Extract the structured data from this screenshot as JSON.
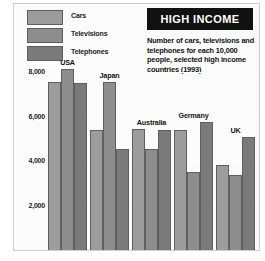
{
  "chart_data": {
    "type": "bar",
    "title": "HIGH INCOME",
    "subtitle": "Number of cars, televisions and telephones for each 10,000 people, selected high income countries (1993)",
    "xlabel": "",
    "ylabel": "",
    "ylim": [
      0,
      8800
    ],
    "grid": true,
    "legend_position": "top-left",
    "yticks": [
      2000,
      4000,
      6000,
      8000
    ],
    "ytick_labels": [
      "2,000",
      "4,000",
      "6,000",
      "8,000"
    ],
    "categories": [
      "USA",
      "Japan",
      "Australia",
      "Germany",
      "UK"
    ],
    "series": [
      {
        "name": "Cars",
        "color": "#9c9c9c",
        "values": [
          7550,
          5400,
          5450,
          5400,
          3800
        ]
      },
      {
        "name": "Televisions",
        "color": "#8d8d8d",
        "values": [
          8150,
          7550,
          4550,
          3500,
          3350
        ]
      },
      {
        "name": "Telephones",
        "color": "#7a7a7a",
        "values": [
          7500,
          4550,
          5400,
          5750,
          5100
        ]
      }
    ]
  },
  "legend": {
    "items": [
      {
        "label": "Cars"
      },
      {
        "label": "Televisions"
      },
      {
        "label": "Telephones"
      }
    ]
  },
  "colors": {
    "cars": "#9c9c9c",
    "televisions": "#8d8d8d",
    "telephones": "#7a7a7a",
    "title_bg": "#111111",
    "title_fg": "#ffffff",
    "canvas": "#fbfbfb",
    "frame": "#cfcfcf"
  }
}
